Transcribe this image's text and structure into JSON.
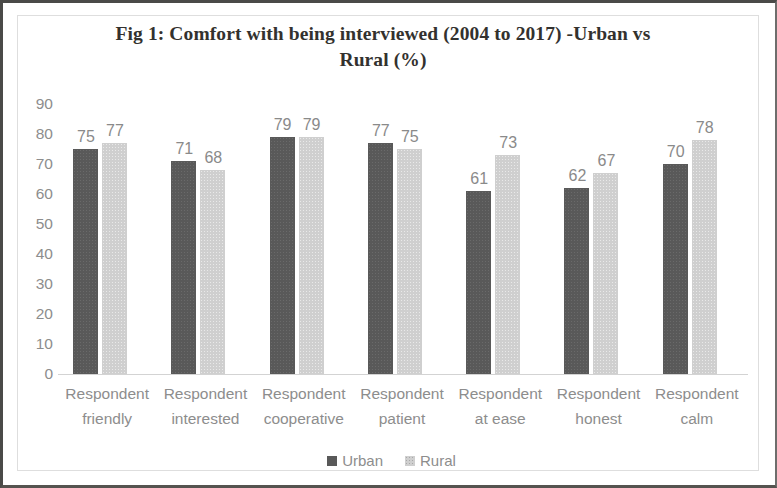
{
  "chart_data": {
    "type": "bar",
    "title": "Fig 1: Comfort with being interviewed (2004 to 2017) -Urban vs Rural (%)",
    "title_line1": "Fig 1: Comfort with being interviewed (2004 to 2017) -Urban vs",
    "title_line2": "Rural (%)",
    "xlabel": "",
    "ylabel": "",
    "ylim": [
      0,
      90
    ],
    "ytick_labels": [
      "90",
      "80",
      "70",
      "60",
      "50",
      "40",
      "30",
      "20",
      "10",
      "0"
    ],
    "grid": false,
    "legend_position": "bottom",
    "categories": [
      "Respondent friendly",
      "Respondent interested",
      "Respondent cooperative",
      "Respondent patient",
      "Respondent at ease",
      "Respondent honest",
      "Respondent calm"
    ],
    "category_lines": [
      {
        "line1": "Respondent",
        "line2": "friendly"
      },
      {
        "line1": "Respondent",
        "line2": "interested"
      },
      {
        "line1": "Respondent",
        "line2": "cooperative"
      },
      {
        "line1": "Respondent",
        "line2": "patient"
      },
      {
        "line1": "Respondent",
        "line2": "at ease"
      },
      {
        "line1": "Respondent",
        "line2": "honest"
      },
      {
        "line1": "Respondent",
        "line2": "calm"
      }
    ],
    "series": [
      {
        "name": "Urban",
        "color": "#595959",
        "values": [
          75,
          71,
          79,
          77,
          61,
          62,
          70
        ]
      },
      {
        "name": "Rural",
        "color": "#cfcfcf",
        "values": [
          77,
          68,
          79,
          75,
          73,
          67,
          78
        ]
      }
    ]
  }
}
